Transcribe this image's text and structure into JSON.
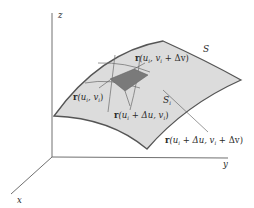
{
  "diagram": {
    "type": "parametric surface patch",
    "axes": {
      "x_label": "x",
      "y_label": "y",
      "z_label": "z"
    },
    "surface_label": "S",
    "patch_label": {
      "main": "S",
      "sub": "i"
    },
    "point_labels": {
      "p1": {
        "fn": "r",
        "text": "(u",
        "sub1": "i",
        "mid": ", v",
        "sub2": "i",
        "tail": ")"
      },
      "p2": {
        "fn": "r",
        "text": "(u",
        "sub1": "i",
        "mid": ", v",
        "sub2": "i",
        "tail": " + Δv)"
      },
      "p3": {
        "fn": "r",
        "text": "(u",
        "sub1": "i",
        "mid": " + Δu, v",
        "sub2": "i",
        "tail": ")"
      },
      "p4": {
        "fn": "r",
        "text": "(u",
        "sub1": "i",
        "mid": " + Δu, v",
        "sub2": "i",
        "tail": " + Δv)"
      }
    },
    "colors": {
      "surface_fill": "#dcdcdc",
      "surface_edge": "#555555",
      "patch_fill": "#7a7a7a",
      "axis": "#707070",
      "grid_line": "#6a6a6a"
    }
  }
}
